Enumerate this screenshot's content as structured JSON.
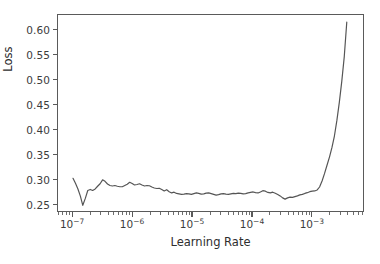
{
  "chart_data": {
    "type": "line",
    "title": "",
    "xlabel": "Learning Rate",
    "ylabel": "Loss",
    "xscale": "log",
    "yscale": "linear",
    "grid": false,
    "legend": null,
    "xlim": [
      5.6e-08,
      0.0074
    ],
    "ylim": [
      0.2355,
      0.6315
    ],
    "xticks": [
      1e-07,
      1e-06,
      1e-05,
      0.0001,
      0.001
    ],
    "xtick_labels": [
      "10−7",
      "10−6",
      "10−5",
      "10−4",
      "10−3"
    ],
    "xtick_mantissas": [
      "10",
      "10",
      "10",
      "10",
      "10"
    ],
    "xtick_exponents": [
      "-7",
      "-6",
      "-5",
      "-4",
      "-3"
    ],
    "yticks": [
      0.25,
      0.3,
      0.35,
      0.4,
      0.45,
      0.5,
      0.55,
      0.6
    ],
    "ytick_labels": [
      "0.25",
      "0.30",
      "0.35",
      "0.40",
      "0.45",
      "0.50",
      "0.55",
      "0.60"
    ],
    "line_color": "#555555",
    "line_width": 1.2,
    "series": [
      {
        "name": "loss",
        "x": [
          1e-07,
          1.1e-07,
          1.21e-07,
          1.33e-07,
          1.46e-07,
          1.61e-07,
          1.77e-07,
          1.95e-07,
          2.14e-07,
          2.36e-07,
          2.59e-07,
          2.85e-07,
          3.14e-07,
          3.45e-07,
          3.8e-07,
          4.18e-07,
          4.59e-07,
          5.05e-07,
          5.56e-07,
          6.12e-07,
          6.73e-07,
          7.4e-07,
          8.14e-07,
          8.95e-07,
          9.85e-07,
          1.08e-06,
          1.19e-06,
          1.31e-06,
          1.44e-06,
          1.59e-06,
          1.75e-06,
          1.92e-06,
          2.11e-06,
          2.32e-06,
          2.56e-06,
          2.81e-06,
          3.09e-06,
          3.4e-06,
          3.74e-06,
          4.12e-06,
          4.53e-06,
          4.98e-06,
          5.48e-06,
          6.03e-06,
          6.63e-06,
          7.3e-06,
          8.03e-06,
          8.83e-06,
          9.71e-06,
          1.07e-05,
          1.18e-05,
          1.29e-05,
          1.42e-05,
          1.57e-05,
          1.72e-05,
          1.9e-05,
          2.09e-05,
          2.3e-05,
          2.53e-05,
          2.78e-05,
          3.06e-05,
          3.36e-05,
          3.7e-05,
          4.07e-05,
          4.48e-05,
          4.92e-05,
          5.42e-05,
          5.96e-05,
          6.55e-05,
          7.21e-05,
          7.93e-05,
          8.72e-05,
          9.59e-05,
          0.000106,
          0.000116,
          0.000128,
          0.00014,
          0.000154,
          0.00017,
          0.000187,
          0.000206,
          0.000226,
          0.000249,
          0.000274,
          0.000301,
          0.000331,
          0.000364,
          0.000401,
          0.000441,
          0.000485,
          0.000533,
          0.000587,
          0.000645,
          0.00071,
          0.000781,
          0.000859,
          0.000945,
          0.00104,
          0.00114,
          0.00126,
          0.00138,
          0.00152,
          0.00167,
          0.00184,
          0.00203,
          0.00223,
          0.00245,
          0.0027,
          0.00297,
          0.00326,
          0.00359,
          0.00395
        ],
        "y": [
          0.3015,
          0.2915,
          0.28,
          0.2655,
          0.247,
          0.261,
          0.277,
          0.279,
          0.277,
          0.28,
          0.2855,
          0.2905,
          0.2985,
          0.2955,
          0.29,
          0.287,
          0.286,
          0.287,
          0.2855,
          0.2845,
          0.2845,
          0.287,
          0.2895,
          0.2935,
          0.291,
          0.288,
          0.289,
          0.2905,
          0.288,
          0.286,
          0.287,
          0.2865,
          0.284,
          0.282,
          0.281,
          0.2815,
          0.279,
          0.276,
          0.2785,
          0.2745,
          0.272,
          0.2735,
          0.271,
          0.27,
          0.269,
          0.2695,
          0.2705,
          0.27,
          0.269,
          0.2705,
          0.272,
          0.271,
          0.2695,
          0.27,
          0.2715,
          0.272,
          0.2705,
          0.269,
          0.2675,
          0.2685,
          0.27,
          0.2705,
          0.2695,
          0.269,
          0.27,
          0.271,
          0.2705,
          0.2715,
          0.271,
          0.27,
          0.2705,
          0.272,
          0.273,
          0.274,
          0.2725,
          0.272,
          0.274,
          0.2765,
          0.2755,
          0.273,
          0.272,
          0.2735,
          0.2715,
          0.269,
          0.266,
          0.262,
          0.2595,
          0.262,
          0.2635,
          0.263,
          0.2645,
          0.266,
          0.268,
          0.269,
          0.271,
          0.2725,
          0.2745,
          0.2755,
          0.276,
          0.278,
          0.284,
          0.296,
          0.311,
          0.328,
          0.345,
          0.364,
          0.387,
          0.419,
          0.456,
          0.498,
          0.548,
          0.617
        ]
      }
    ]
  }
}
